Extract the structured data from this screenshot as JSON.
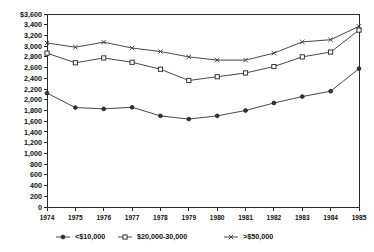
{
  "chart_data": {
    "type": "line",
    "title": "",
    "subtitle": "",
    "xlabel": "",
    "ylabel": "",
    "grid": false,
    "legend_position": "bottom",
    "x": [
      1974,
      1975,
      1976,
      1977,
      1978,
      1979,
      1980,
      1981,
      1982,
      1983,
      1984,
      1985
    ],
    "categories": [
      "1974",
      "1975",
      "1976",
      "1977",
      "1978",
      "1979",
      "1980",
      "1981",
      "1982",
      "1983",
      "1984",
      "1985"
    ],
    "xlim": [
      1974,
      1985
    ],
    "ylim": [
      0,
      3600
    ],
    "ytick_labels": [
      "$3,600",
      "3,400",
      "3,200",
      "3,000",
      "2,800",
      "2,600",
      "2,400",
      "2,200",
      "2,000",
      "1,800",
      "1,600",
      "1,400",
      "1,200",
      "1,000",
      "800",
      "600",
      "400",
      "200",
      "0"
    ],
    "ytick_values": [
      3600,
      3400,
      3200,
      3000,
      2800,
      2600,
      2400,
      2200,
      2000,
      1800,
      1600,
      1400,
      1200,
      1000,
      800,
      600,
      400,
      200,
      0
    ],
    "series": [
      {
        "name": ">$50,000",
        "marker": "x",
        "values": [
          3060,
          2980,
          3075,
          2965,
          2900,
          2800,
          2740,
          2740,
          2870,
          3080,
          3120,
          3370
        ]
      },
      {
        "name": "$20,000-30,000",
        "marker": "square",
        "values": [
          2870,
          2690,
          2780,
          2700,
          2570,
          2360,
          2430,
          2500,
          2620,
          2800,
          2890,
          3300
        ]
      },
      {
        "name": "<$10,000",
        "marker": "diamond",
        "values": [
          2125,
          1855,
          1830,
          1860,
          1700,
          1640,
          1700,
          1800,
          1940,
          2060,
          2160,
          2580
        ]
      }
    ]
  },
  "legend": {
    "items": [
      {
        "label": "<$10,000",
        "marker": "diamond"
      },
      {
        "label": "$20,000-30,000",
        "marker": "square"
      },
      {
        "label": ">$50,000",
        "marker": "x"
      }
    ]
  },
  "colors": {
    "axis": "#2b2b2b",
    "series": "#333333",
    "background": "#ffffff"
  }
}
